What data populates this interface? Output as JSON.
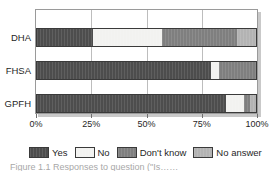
{
  "chart_data": {
    "type": "bar",
    "orientation": "horizontal",
    "stacked": true,
    "normalized_percent": true,
    "title": "",
    "xlabel": "",
    "ylabel": "",
    "xlim": [
      0,
      100
    ],
    "grid": true,
    "legend_position": "bottom",
    "categories": [
      "DHA",
      "FHSA",
      "GPFH"
    ],
    "xtick_labels": [
      "0%",
      "25%",
      "50%",
      "75%",
      "100%"
    ],
    "xtick_values": [
      0,
      25,
      50,
      75,
      100
    ],
    "series": [
      {
        "name": "Yes",
        "color": "#4d4d4d",
        "values": [
          26,
          79,
          86
        ]
      },
      {
        "name": "No",
        "color": "#f2f2f0",
        "values": [
          31,
          4,
          8
        ]
      },
      {
        "name": "Don't know",
        "color": "#7f7f7f",
        "values": [
          34,
          17,
          3
        ]
      },
      {
        "name": "No answer",
        "color": "#b3b3b3",
        "values": [
          9,
          0,
          3
        ]
      }
    ]
  },
  "legend": {
    "items": [
      {
        "label": "Yes",
        "swatch": "sw-yes"
      },
      {
        "label": "No",
        "swatch": "sw-no"
      },
      {
        "label": "Don't know",
        "swatch": "sw-dontknow"
      },
      {
        "label": "No answer",
        "swatch": "sw-noanswer"
      }
    ]
  },
  "caption": {
    "text": "Figure 1.1   Responses to question (\"Is……"
  }
}
